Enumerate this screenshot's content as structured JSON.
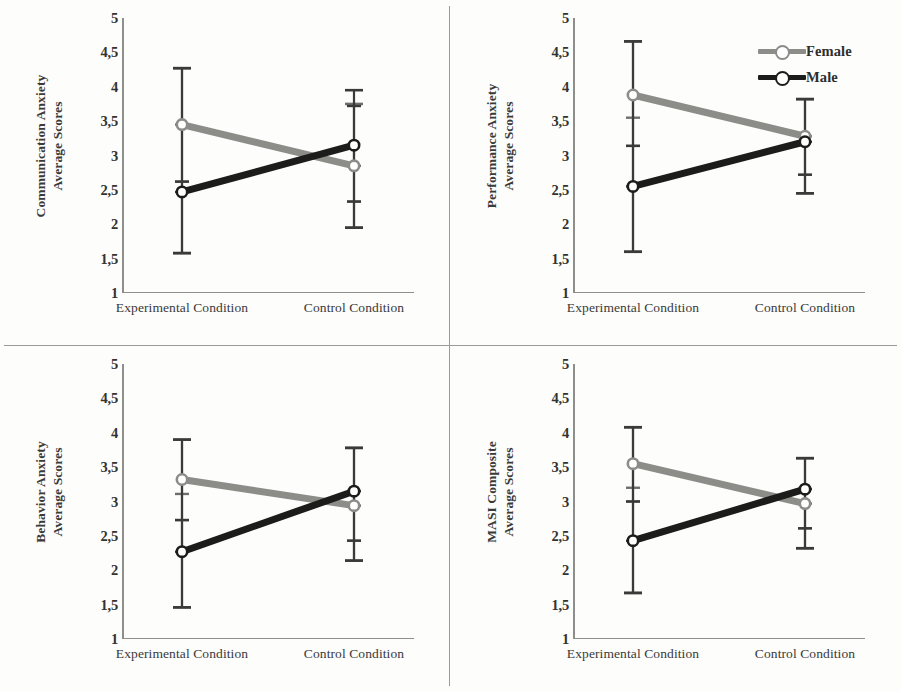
{
  "figure": {
    "panel_count": 4,
    "xlabels": [
      "Experimental Condition",
      "Control Condition"
    ],
    "ytick_labels": [
      "5",
      "4,5",
      "4",
      "3,5",
      "3",
      "2,5",
      "2",
      "1,5",
      "1"
    ],
    "ytick_values": [
      5,
      4.5,
      4,
      3.5,
      3,
      2.5,
      2,
      1.5,
      1
    ],
    "ylim": [
      1,
      5
    ],
    "colors": {
      "female": "#8c8c88",
      "male": "#1c1c1a",
      "axis": "#8e8e8a",
      "divider": "#9a9a96",
      "background": "#fdfdfc",
      "text": "#33332f"
    }
  },
  "legend": {
    "position": "top-right of panel 2",
    "entries": [
      {
        "label": "Female",
        "color": "#8c8c88",
        "marker": "circle-open"
      },
      {
        "label": "Male",
        "color": "#1c1c1a",
        "marker": "circle-open"
      }
    ]
  },
  "chart_data": [
    {
      "type": "line",
      "title": "",
      "ylabel_line1": "Communication Anxiety",
      "ylabel_line2": "Average Scores",
      "xlabel": "",
      "categories": [
        "Experimental Condition",
        "Control Condition"
      ],
      "ylim": [
        1,
        5
      ],
      "grid": false,
      "legend": "none",
      "series": [
        {
          "name": "Female",
          "color": "#8c8c88",
          "values": [
            3.45,
            2.85
          ],
          "err_low": [
            1.58,
            1.95
          ],
          "err_high": [
            4.27,
            3.75
          ],
          "inner_low": [
            2.62,
            2.33
          ],
          "inner_high": [
            3.45,
            2.85
          ]
        },
        {
          "name": "Male",
          "color": "#1c1c1a",
          "values": [
            2.47,
            3.15
          ],
          "err_low": [
            1.58,
            1.95
          ],
          "err_high": [
            4.27,
            3.95
          ],
          "inner_low": [
            2.47,
            2.33
          ],
          "inner_high": [
            2.62,
            3.72
          ]
        }
      ]
    },
    {
      "type": "line",
      "title": "",
      "ylabel_line1": "Performance Anxiety",
      "ylabel_line2": "Average Scores",
      "xlabel": "",
      "categories": [
        "Experimental Condition",
        "Control Condition"
      ],
      "ylim": [
        1,
        5
      ],
      "grid": false,
      "legend": "top-right",
      "series": [
        {
          "name": "Female",
          "color": "#8c8c88",
          "values": [
            3.88,
            3.28
          ],
          "err_low": [
            1.6,
            2.45
          ],
          "err_high": [
            4.66,
            3.82
          ],
          "inner_low": [
            3.14,
            2.72
          ],
          "inner_high": [
            3.55,
            3.28
          ]
        },
        {
          "name": "Male",
          "color": "#1c1c1a",
          "values": [
            2.55,
            3.2
          ],
          "err_low": [
            1.6,
            2.45
          ],
          "err_high": [
            4.66,
            3.82
          ],
          "inner_low": [
            2.55,
            2.72
          ],
          "inner_high": [
            3.14,
            3.2
          ]
        }
      ]
    },
    {
      "type": "line",
      "title": "",
      "ylabel_line1": "Behavior Anxiety",
      "ylabel_line2": "Average Scores",
      "xlabel": "",
      "categories": [
        "Experimental Condition",
        "Control Condition"
      ],
      "ylim": [
        1,
        5
      ],
      "grid": false,
      "legend": "none",
      "series": [
        {
          "name": "Female",
          "color": "#8c8c88",
          "values": [
            3.32,
            2.94
          ],
          "err_low": [
            1.46,
            2.14
          ],
          "err_high": [
            3.9,
            3.78
          ],
          "inner_low": [
            2.73,
            2.43
          ],
          "inner_high": [
            3.11,
            2.94
          ]
        },
        {
          "name": "Male",
          "color": "#1c1c1a",
          "values": [
            2.27,
            3.15
          ],
          "err_low": [
            1.46,
            2.14
          ],
          "err_high": [
            3.9,
            3.78
          ],
          "inner_low": [
            2.27,
            2.43
          ],
          "inner_high": [
            2.73,
            3.15
          ]
        }
      ]
    },
    {
      "type": "line",
      "title": "",
      "ylabel_line1": "MASI Composite",
      "ylabel_line2": "Average Scores",
      "xlabel": "",
      "categories": [
        "Experimental Condition",
        "Control Condition"
      ],
      "ylim": [
        1,
        5
      ],
      "grid": false,
      "legend": "none",
      "series": [
        {
          "name": "Female",
          "color": "#8c8c88",
          "values": [
            3.55,
            2.97
          ],
          "err_low": [
            1.67,
            2.32
          ],
          "err_high": [
            4.08,
            3.63
          ],
          "inner_low": [
            3.0,
            2.61
          ],
          "inner_high": [
            3.2,
            2.97
          ]
        },
        {
          "name": "Male",
          "color": "#1c1c1a",
          "values": [
            2.43,
            3.18
          ],
          "err_low": [
            1.67,
            2.32
          ],
          "err_high": [
            4.08,
            3.63
          ],
          "inner_low": [
            2.43,
            2.61
          ],
          "inner_high": [
            3.0,
            3.18
          ]
        }
      ]
    }
  ]
}
